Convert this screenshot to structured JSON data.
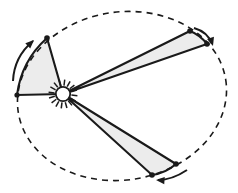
{
  "figure": {
    "background_color": "#ffffff"
  },
  "colors": {
    "stroke": "#1a1a1a",
    "sector_fill": "#ececec",
    "sun_fill": "#ffffff",
    "orbit_stroke": "#1a1a1a"
  },
  "orbit": {
    "name": "elliptical-orbit",
    "style": "dashed",
    "center_x": 122,
    "center_y": 96,
    "radius_x": 105,
    "radius_y": 84,
    "rotation_deg": -9,
    "dash_pattern": "6 5",
    "stroke_width": 1.6
  },
  "sun": {
    "name": "sun",
    "center_x": 63,
    "center_y": 94,
    "disk_radius": 7.2,
    "ray_count": 16,
    "ray_inner": 8.5,
    "ray_outer": 14.5,
    "stroke_width": 1.5
  },
  "sectors": [
    {
      "name": "sector-upper-left",
      "label": "equal-area-sector-1",
      "apex_x": 63,
      "apex_y": 94,
      "p1_x": 17,
      "p1_y": 95,
      "p2_x": 47,
      "p2_y": 38,
      "bulge": 12,
      "stroke_width": 2.1
    },
    {
      "name": "sector-upper-right",
      "label": "equal-area-sector-2",
      "apex_x": 63,
      "apex_y": 94,
      "p1_x": 190,
      "p1_y": 31,
      "p2_x": 207,
      "p2_y": 44,
      "bulge": 3,
      "stroke_width": 2.1
    },
    {
      "name": "sector-lower-right",
      "label": "equal-area-sector-3",
      "apex_x": 63,
      "apex_y": 94,
      "p1_x": 176,
      "p1_y": 164,
      "p2_x": 152,
      "p2_y": 175,
      "bulge": 4,
      "stroke_width": 2.1
    }
  ],
  "node_dots": [
    {
      "name": "orbit-node-left",
      "x": 17,
      "y": 95,
      "r": 2.6
    },
    {
      "name": "orbit-node-upper-left",
      "x": 47,
      "y": 38,
      "r": 2.8
    },
    {
      "name": "orbit-node-upper-right-a",
      "x": 190,
      "y": 31,
      "r": 2.8
    },
    {
      "name": "orbit-node-upper-right-b",
      "x": 207,
      "y": 44,
      "r": 2.8
    },
    {
      "name": "orbit-node-lower-right-a",
      "x": 176,
      "y": 164,
      "r": 2.8
    },
    {
      "name": "orbit-node-lower-right-b",
      "x": 152,
      "y": 175,
      "r": 2.8
    }
  ],
  "motion_arrows": [
    {
      "name": "motion-arrow-left",
      "path": "M 13 81 Q 14 57 33 41",
      "head_x": 34,
      "head_y": 40,
      "head_angle_deg": -43,
      "stroke_width": 2.0
    },
    {
      "name": "motion-arrow-upper-right",
      "path": "M 194 28 Q 208 32 212 44",
      "head_x": 213,
      "head_y": 46,
      "head_angle_deg": 73,
      "stroke_width": 2.0
    },
    {
      "name": "motion-arrow-lower-right",
      "path": "M 187 170 Q 172 180 158 180",
      "head_x": 156,
      "head_y": 180,
      "head_angle_deg": 184,
      "stroke_width": 2.0
    }
  ],
  "chart_data": {
    "type": "scatter",
    "xlabel": "",
    "ylabel": "",
    "focus": {
      "name": "Sun",
      "x": 63,
      "y": 94
    },
    "orbit_points_labeled": [
      {
        "name": "node-left",
        "x": 17,
        "y": 95
      },
      {
        "name": "node-upper-left",
        "x": 47,
        "y": 38
      },
      {
        "name": "node-upper-right-a",
        "x": 190,
        "y": 31
      },
      {
        "name": "node-upper-right-b",
        "x": 207,
        "y": 44
      },
      {
        "name": "node-lower-right-a",
        "x": 176,
        "y": 164
      },
      {
        "name": "node-lower-right-b",
        "x": 152,
        "y": 175
      }
    ],
    "swept_sectors": 3,
    "legend": []
  }
}
